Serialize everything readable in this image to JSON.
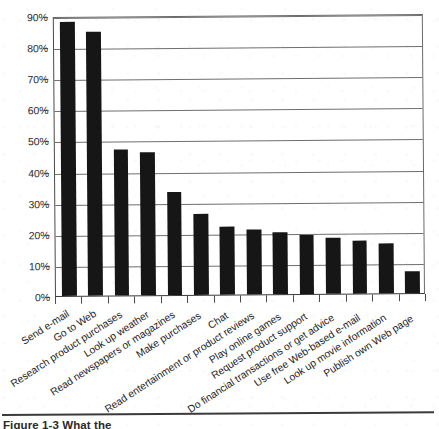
{
  "chart_data": {
    "type": "bar",
    "title": "",
    "subtitle": "",
    "xlabel": "",
    "ylabel": "",
    "ylim": [
      0,
      90
    ],
    "ytick_labels": [
      "90%",
      "80%",
      "70%",
      "60%",
      "50%",
      "40%",
      "30%",
      "20%",
      "10%",
      "0%"
    ],
    "ytick_values": [
      90,
      80,
      70,
      60,
      50,
      40,
      30,
      20,
      10,
      0
    ],
    "grid": true,
    "legend": false,
    "legend_position": "none",
    "bar_color": "#161616",
    "categories": [
      "Send e-mail",
      "Go to Web",
      "Research product purchases",
      "Look up weather",
      "Read newspapers or magazines",
      "Make purchases",
      "Chat",
      "Read entertainment or product reviews",
      "Play online games",
      "Request product support",
      "Do financial transactions or get advice",
      "Use free Web-based e-mail",
      "Look up movie information",
      "Publish own Web page"
    ],
    "values": [
      88,
      85,
      47,
      46,
      33,
      26,
      22,
      21,
      20,
      19,
      18,
      17,
      16,
      7
    ]
  },
  "caption": {
    "text": "Figure 1-3   What the"
  },
  "axes": {
    "y_axis_name": "percent-axis",
    "x_axis_name": "activity-axis"
  }
}
